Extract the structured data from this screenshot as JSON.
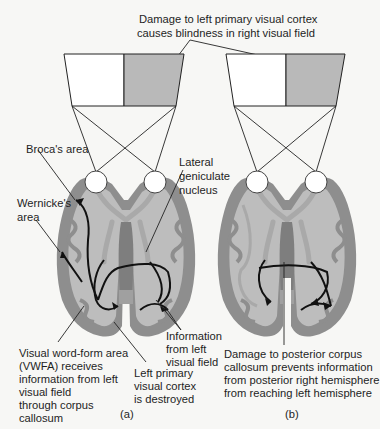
{
  "figure": {
    "top_caption": [
      "Damage to left primary visual cortex",
      "causes blindness in right visual field"
    ],
    "panels": [
      {
        "id": "a",
        "panel_label": "(a)",
        "visual_field": {
          "left_half": "intact",
          "right_half": "blind"
        },
        "labels": {
          "broca": "Broca's area",
          "wernicke": [
            "Wernicke's",
            "area"
          ],
          "lgn": [
            "Lateral",
            "geniculate",
            "nucleus"
          ],
          "vwfa": [
            "Visual word-form area",
            "(VWFA) receives",
            "information from left",
            "visual field",
            "through corpus",
            "callosum"
          ],
          "v1_destroyed": [
            "Left primary",
            "visual cortex",
            "is destroyed"
          ],
          "info_left_field": [
            "Information",
            "from left",
            "visual field"
          ]
        }
      },
      {
        "id": "b",
        "panel_label": "(b)",
        "visual_field": {
          "left_half": "intact",
          "right_half": "blind"
        },
        "labels": {
          "callosum_damage": [
            "Damage to posterior corpus",
            "callosum prevents information",
            "from posterior right hemisphere",
            "from reaching left hemisphere"
          ]
        }
      }
    ],
    "colors": {
      "blind_field": "#b9b9b9",
      "intact_field": "#ffffff",
      "cortex_gray": "#8e8e8e",
      "white_matter": "#bdbdbd",
      "background": "#f7f7f5"
    }
  }
}
